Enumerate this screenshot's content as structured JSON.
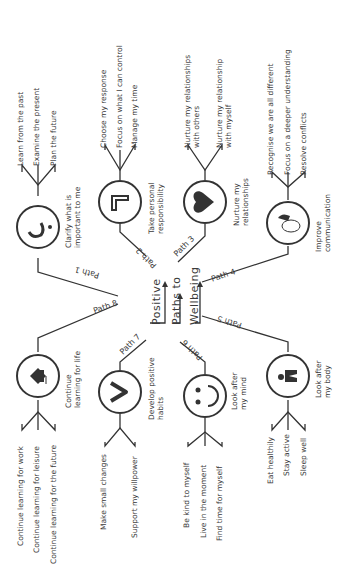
{
  "title": {
    "line1": "Positive",
    "line2": "Paths to",
    "line3": "Wellbeing"
  },
  "colors": {
    "stroke": "#333333",
    "text": "#3a3a3a",
    "background": "#ffffff"
  },
  "paths": [
    {
      "label": "Path 1",
      "icon": "question-mark-icon",
      "name": "Clarify what is important to me",
      "name_lines": [
        "Clarify what is",
        "important to me"
      ],
      "items": [
        "Learn from the past",
        "Examine the present",
        "Plan the future"
      ]
    },
    {
      "label": "Path 2",
      "icon": "corner-bracket-icon",
      "name": "Take personal responsibility",
      "name_lines": [
        "Take personal",
        "responsibility"
      ],
      "items": [
        "Choose my response",
        "Focus on what I can control",
        "Manage my time"
      ]
    },
    {
      "label": "Path 3",
      "icon": "heart-icon",
      "name": "Nurture my relationships",
      "name_lines": [
        "Nurture my",
        "relationships"
      ],
      "items": [
        "Nurture my relationships with others",
        "Nurture my relationship with myself"
      ],
      "items_lines": [
        [
          "Nurture my relationships",
          "with others"
        ],
        [
          "Nurture my relationship",
          "with myself"
        ]
      ]
    },
    {
      "label": "Path 4",
      "icon": "speech-bubble-icon",
      "name": "Improve communication",
      "name_lines": [
        "Improve",
        "communication"
      ],
      "items": [
        "Recognise we are all different",
        "Focus on a deeper understanding",
        "Resolve conflicts"
      ]
    },
    {
      "label": "Path 5",
      "icon": "active-person-icon",
      "name": "Look after my body",
      "name_lines": [
        "Look after",
        "my body"
      ],
      "items": [
        "Eat healthily",
        "Stay active",
        "Sleep well"
      ]
    },
    {
      "label": "Path 6",
      "icon": "smiley-face-icon",
      "name": "Look after my mind",
      "name_lines": [
        "Look after",
        "my mind"
      ],
      "items": [
        "Be kind to myself",
        "Live in the moment",
        "Find time for myself"
      ]
    },
    {
      "label": "Path 7",
      "icon": "chevron-icon",
      "name": "Develop positive habits",
      "name_lines": [
        "Develop positive",
        "habits"
      ],
      "items": [
        "Make small changes",
        "Support my willpower"
      ]
    },
    {
      "label": "Path 8",
      "icon": "graduation-cap-icon",
      "name": "Continue learning for life",
      "name_lines": [
        "Continue",
        "learning for life"
      ],
      "items": [
        "Continue learning for work",
        "Continue learning for leisure",
        "Continue learning for the future"
      ]
    }
  ]
}
